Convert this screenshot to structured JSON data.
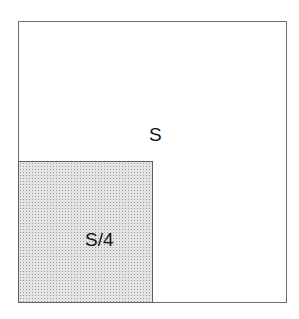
{
  "diagram": {
    "outer_region": {
      "label": "S",
      "fill": "#ffffff",
      "border": "#6e6e6e"
    },
    "inner_region": {
      "label": "S/4",
      "fill": "dotted-gray",
      "border": "#5e5e5e"
    }
  }
}
